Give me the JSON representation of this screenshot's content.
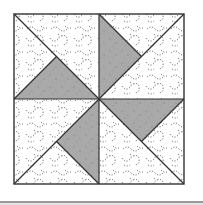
{
  "diagram": {
    "type": "quilt-block",
    "name": "pinwheel",
    "grid": "2x2 quadrants",
    "colors": {
      "background": "#ffffff",
      "print_fabric": "#ffffff",
      "print_speckle": "#555555",
      "solid_fabric": "#a9a9a9",
      "seam_line": "#333333",
      "rule": "#9a9a9a"
    },
    "pieces": [
      {
        "quadrant": "top-left",
        "fabric": "solid",
        "shape": "triangle",
        "points": "left-edge-mid, center, quadrant-center"
      },
      {
        "quadrant": "top-right",
        "fabric": "solid",
        "shape": "triangle",
        "points": "top-edge-mid, center, quadrant-center"
      },
      {
        "quadrant": "bottom-right",
        "fabric": "solid",
        "shape": "triangle",
        "points": "right-edge-mid, center, quadrant-center"
      },
      {
        "quadrant": "bottom-left",
        "fabric": "solid",
        "shape": "triangle",
        "points": "bottom-edge-mid, center, quadrant-center"
      }
    ]
  }
}
